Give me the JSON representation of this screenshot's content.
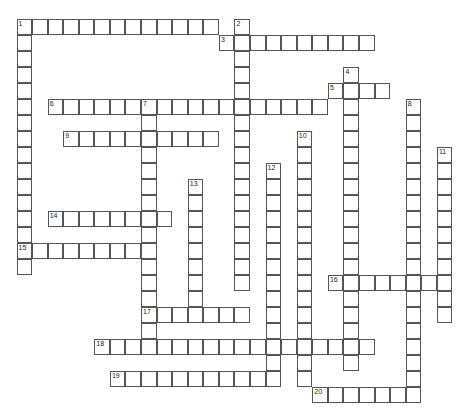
{
  "puzzle": {
    "type": "crossword",
    "grid": {
      "origin_x": 17,
      "origin_y": 19,
      "cell_w": 15.57,
      "cell_h": 16
    },
    "colors": {
      "border": "#555555",
      "cell_bg": "#ffffff",
      "number": "#222222"
    },
    "entries": [
      {
        "number": "1",
        "direction": "across",
        "row": 0,
        "col": 0,
        "length": 13
      },
      {
        "number": "1",
        "direction": "down",
        "row": 0,
        "col": 0,
        "length": 16
      },
      {
        "number": "2",
        "direction": "down",
        "row": 0,
        "col": 14,
        "length": 17
      },
      {
        "number": "3",
        "direction": "across",
        "row": 1,
        "col": 13,
        "length": 10
      },
      {
        "number": "4",
        "direction": "down",
        "row": 3,
        "col": 21,
        "length": 19
      },
      {
        "number": "5",
        "direction": "across",
        "row": 4,
        "col": 20,
        "length": 4
      },
      {
        "number": "6",
        "direction": "across",
        "row": 5,
        "col": 2,
        "length": 18
      },
      {
        "number": "7",
        "direction": "down",
        "row": 5,
        "col": 8,
        "length": 16
      },
      {
        "number": "8",
        "direction": "down",
        "row": 5,
        "col": 25,
        "length": 19
      },
      {
        "number": "9",
        "direction": "across",
        "row": 7,
        "col": 3,
        "length": 10
      },
      {
        "number": "10",
        "direction": "down",
        "row": 7,
        "col": 18,
        "length": 16
      },
      {
        "number": "11",
        "direction": "down",
        "row": 8,
        "col": 27,
        "length": 11
      },
      {
        "number": "12",
        "direction": "down",
        "row": 9,
        "col": 16,
        "length": 14
      },
      {
        "number": "13",
        "direction": "down",
        "row": 10,
        "col": 11,
        "length": 9
      },
      {
        "number": "14",
        "direction": "across",
        "row": 12,
        "col": 2,
        "length": 8
      },
      {
        "number": "15",
        "direction": "across",
        "row": 14,
        "col": 0,
        "length": 9
      },
      {
        "number": "16",
        "direction": "across",
        "row": 16,
        "col": 20,
        "length": 8
      },
      {
        "number": "17",
        "direction": "across",
        "row": 18,
        "col": 8,
        "length": 7
      },
      {
        "number": "18",
        "direction": "across",
        "row": 20,
        "col": 5,
        "length": 18
      },
      {
        "number": "19",
        "direction": "across",
        "row": 22,
        "col": 6,
        "length": 11
      },
      {
        "number": "20",
        "direction": "across",
        "row": 23,
        "col": 19,
        "length": 7
      }
    ]
  }
}
